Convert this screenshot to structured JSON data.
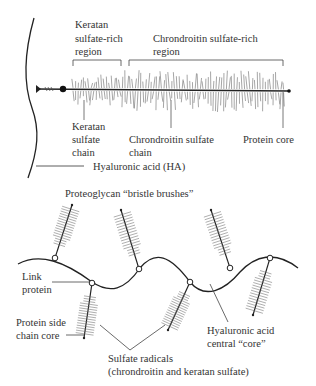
{
  "diagram": {
    "type": "proteoglycan-structure",
    "colors": {
      "ink": "#222222",
      "label": "#333333",
      "bristle": "#6a6a6a",
      "background": "#ffffff"
    },
    "top_panel": {
      "labels": {
        "keratan_region": [
          "Keratan",
          "sulfate-rich",
          "region"
        ],
        "chondroitin_region": [
          "Chrondroitin sulfate-rich",
          "region"
        ],
        "keratan_chain": [
          "Keratan",
          "sulfate",
          "chain"
        ],
        "chondroitin_chain": [
          "Chrondroitin sulfate",
          "chain"
        ],
        "protein_core": "Protein core",
        "hyaluronic_acid": "Hyaluronic acid (HA)"
      }
    },
    "bottom_panel": {
      "labels": {
        "bristle_brushes": "Proteoglycan “bristle brushes”",
        "link_protein": [
          "Link",
          "protein"
        ],
        "protein_side_chain": [
          "Protein side",
          "chain core"
        ],
        "hyaluronic_core": [
          "Hyaluronic acid",
          "central “core”"
        ],
        "sulfate_radicals": [
          "Sulfate radicals",
          "(chrondroitin and keratan sulfate)"
        ]
      },
      "brush_count": 7
    }
  }
}
